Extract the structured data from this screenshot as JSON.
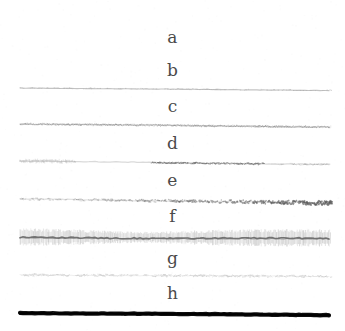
{
  "figure": {
    "title": "",
    "background_color": "#ffffff",
    "width": 345,
    "height": 331,
    "label_color": "#4a4a4a"
  },
  "chart_data": {
    "type": "line",
    "title": "",
    "subtitle": "",
    "xlabel": "",
    "ylabel": "",
    "grid": false,
    "legend": "inline-labels-above-each-trace",
    "x_range": [
      20,
      331
    ],
    "series": [
      {
        "name": "a",
        "label": "a",
        "label_x": 172,
        "label_y": 41,
        "baseline_y": 53,
        "visible": false,
        "stroke_color": "#ffffff",
        "stroke_width": 0,
        "opacity": 0.0,
        "texture": "none",
        "intensity": 0
      },
      {
        "name": "b",
        "label": "b",
        "label_x": 172,
        "label_y": 74,
        "baseline_y": 88,
        "visible": true,
        "stroke_color": "#b9b9b9",
        "stroke_width": 1.1,
        "opacity": 0.85,
        "texture": "smooth",
        "intensity": 1,
        "slope": 2.5
      },
      {
        "name": "c",
        "label": "c",
        "label_x": 172,
        "label_y": 110,
        "baseline_y": 124,
        "visible": true,
        "stroke_color": "#9a9a9a",
        "stroke_width": 1.6,
        "opacity": 0.9,
        "texture": "fine-noise",
        "intensity": 2,
        "slope": 3.0
      },
      {
        "name": "d",
        "label": "d",
        "label_x": 172,
        "label_y": 147,
        "baseline_y": 161,
        "visible": true,
        "stroke_color": "#8e8e8e",
        "stroke_width": 1.8,
        "opacity": 0.85,
        "texture": "patchy",
        "intensity": 3,
        "slope": 3.5
      },
      {
        "name": "e",
        "label": "e",
        "label_x": 172,
        "label_y": 184,
        "baseline_y": 199,
        "visible": true,
        "stroke_color": "#7a7a7a",
        "stroke_width": 2.2,
        "opacity": 0.9,
        "texture": "rough-right-heavy",
        "intensity": 4,
        "slope": 4.0
      },
      {
        "name": "f",
        "label": "f",
        "label_x": 172,
        "label_y": 220,
        "baseline_y": 237,
        "visible": true,
        "stroke_color": "#8a8a8a",
        "stroke_width": 14,
        "opacity": 0.85,
        "texture": "hatched-band",
        "intensity": 5,
        "slope": 1.0
      },
      {
        "name": "g",
        "label": "g",
        "label_x": 172,
        "label_y": 262,
        "baseline_y": 275,
        "visible": true,
        "stroke_color": "#bdbdbd",
        "stroke_width": 1.4,
        "opacity": 0.8,
        "texture": "dashed-noise",
        "intensity": 2,
        "slope": 1.5
      },
      {
        "name": "h",
        "label": "h",
        "label_x": 172,
        "label_y": 297,
        "baseline_y": 313,
        "visible": true,
        "stroke_color": "#111111",
        "stroke_width": 4.2,
        "opacity": 1.0,
        "texture": "solid",
        "intensity": 8,
        "slope": 2.0
      }
    ]
  }
}
